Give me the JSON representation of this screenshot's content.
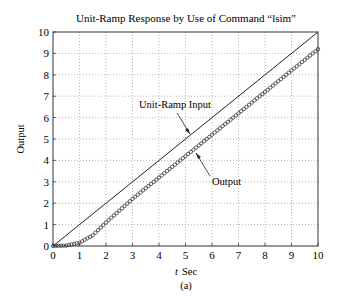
{
  "chart_data": {
    "type": "line",
    "title": "Unit-Ramp Response by Use of Command “lsim”",
    "xlabel_italic": "t",
    "xlabel": "Sec",
    "ylabel": "Output",
    "caption": "(a)",
    "xlim": [
      0,
      10
    ],
    "ylim": [
      0,
      10
    ],
    "xticks": [
      "0",
      "1",
      "2",
      "3",
      "4",
      "5",
      "6",
      "7",
      "8",
      "9",
      "10"
    ],
    "yticks": [
      "0",
      "1",
      "2",
      "3",
      "4",
      "5",
      "6",
      "7",
      "8",
      "9",
      "10"
    ],
    "grid": true,
    "grid_style": "dotted",
    "series": [
      {
        "name": "Unit-Ramp Input",
        "style": "solid line",
        "x": [
          0,
          10
        ],
        "y": [
          0,
          10
        ]
      },
      {
        "name": "Output",
        "style": "circle markers",
        "x": [
          0,
          0.5,
          1,
          1.5,
          2,
          2.5,
          3,
          4,
          5,
          6,
          7,
          8,
          9,
          10
        ],
        "y": [
          0,
          0.02,
          0.15,
          0.5,
          1.1,
          1.65,
          2.2,
          3.2,
          4.2,
          5.2,
          6.2,
          7.2,
          8.2,
          9.2
        ]
      }
    ],
    "annotations": [
      {
        "text": "Unit-Ramp Input",
        "points_to": "Unit-Ramp Input",
        "at_x": 5.2
      },
      {
        "text": "Output",
        "points_to": "Output",
        "at_x": 5.3
      }
    ]
  }
}
